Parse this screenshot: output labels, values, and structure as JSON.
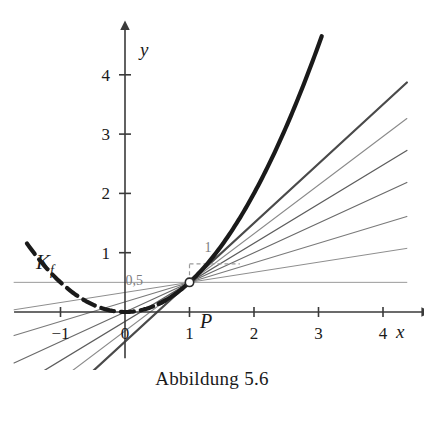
{
  "figure": {
    "caption": "Abbildung 5.6",
    "curve_label": "K_f",
    "curve_label_base": "K",
    "curve_label_sub": "f",
    "point_label": "P"
  },
  "axes": {
    "x_axis_name": "x",
    "y_axis_name": "y",
    "x_ticks": [
      {
        "value": -1,
        "label": "−1"
      },
      {
        "value": 0,
        "label": "0"
      },
      {
        "value": 1,
        "label": "1"
      },
      {
        "value": 2,
        "label": "2"
      },
      {
        "value": 3,
        "label": "3"
      },
      {
        "value": 4,
        "label": "4"
      }
    ],
    "y_ticks": [
      {
        "value": 1,
        "label": "1"
      },
      {
        "value": 2,
        "label": "2"
      },
      {
        "value": 3,
        "label": "3"
      },
      {
        "value": 4,
        "label": "4"
      }
    ],
    "x_range": [
      -1.72,
      4.62
    ],
    "y_range": [
      -0.78,
      4.78
    ],
    "origin_px": [
      125,
      312
    ],
    "px_per_unit_x": 64.5,
    "px_per_unit_y": 59.3
  },
  "annotations": {
    "run_label": "1",
    "rise_label": "0,5",
    "slope_triangle": {
      "from": [
        1,
        0.5
      ],
      "run": 1,
      "rise": 0.5
    }
  },
  "chart_data": {
    "type": "line",
    "title": "Abbildung 5.6",
    "xlabel": "x",
    "ylabel": "y",
    "xlim": [
      -1.72,
      4.62
    ],
    "ylim": [
      -0.78,
      4.78
    ],
    "grid": false,
    "legend": "none",
    "series": [
      {
        "name": "K_f",
        "role": "function-curve",
        "type": "line",
        "style": "thick-black-dashed-left-solid-right",
        "color": "#1a1a1a",
        "formula": "y = 0.5 * x^2",
        "x_start": -1.52,
        "x_end": 3.05,
        "points": [
          {
            "x": -1.52,
            "y": 1.16
          },
          {
            "x": -1.25,
            "y": 0.78
          },
          {
            "x": -1.0,
            "y": 0.5
          },
          {
            "x": -0.75,
            "y": 0.28
          },
          {
            "x": -0.5,
            "y": 0.13
          },
          {
            "x": -0.25,
            "y": 0.03
          },
          {
            "x": 0.0,
            "y": 0.0
          },
          {
            "x": 0.25,
            "y": 0.03
          },
          {
            "x": 0.5,
            "y": 0.13
          },
          {
            "x": 0.75,
            "y": 0.28
          },
          {
            "x": 1.0,
            "y": 0.5
          },
          {
            "x": 1.5,
            "y": 1.13
          },
          {
            "x": 2.0,
            "y": 2.0
          },
          {
            "x": 2.5,
            "y": 3.13
          },
          {
            "x": 3.05,
            "y": 4.65
          }
        ]
      },
      {
        "name": "secant-0",
        "role": "secant",
        "type": "line",
        "color": "#9a9a9a",
        "through": [
          1,
          0.5
        ],
        "slope": 0.0,
        "weight": 1.0
      },
      {
        "name": "secant-1",
        "role": "secant",
        "type": "line",
        "color": "#8e8e8e",
        "through": [
          1,
          0.5
        ],
        "slope": 0.17,
        "weight": 1.0
      },
      {
        "name": "secant-2",
        "role": "secant",
        "type": "line",
        "color": "#7a7a7a",
        "through": [
          1,
          0.5
        ],
        "slope": 0.33,
        "weight": 1.1
      },
      {
        "name": "secant-3",
        "role": "secant",
        "type": "line",
        "color": "#6a6a6a",
        "through": [
          1,
          0.5
        ],
        "slope": 0.5,
        "weight": 1.2
      },
      {
        "name": "secant-4",
        "role": "secant",
        "type": "line",
        "color": "#5d5d5d",
        "through": [
          1,
          0.5
        ],
        "slope": 0.66,
        "weight": 1.3
      },
      {
        "name": "secant-5",
        "role": "secant",
        "type": "line",
        "color": "#8a8a8a",
        "through": [
          1,
          0.5
        ],
        "slope": 0.82,
        "weight": 1.1
      },
      {
        "name": "tangent",
        "role": "tangent",
        "type": "line",
        "color": "#4a4a4a",
        "through": [
          1,
          0.5
        ],
        "slope": 1.0,
        "weight": 2.2
      }
    ],
    "markers": [
      {
        "name": "P",
        "x": 1,
        "y": 0.5,
        "style": "open-circle"
      }
    ],
    "annotations": [
      {
        "text": "K_f",
        "x": -1.38,
        "y": 1.55
      },
      {
        "text": "P",
        "x": 1.16,
        "y": 0.19
      },
      {
        "text": "1",
        "x": 1.43,
        "y": 1.02
      },
      {
        "text": "0,5",
        "x": 0.48,
        "y": 0.72
      }
    ]
  }
}
